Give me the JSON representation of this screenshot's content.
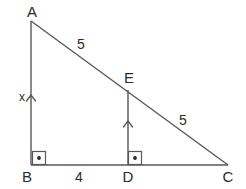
{
  "diagram": {
    "background_color": "#ffffff",
    "stroke_color": "#58585a",
    "text_color": "#2b2b2b",
    "vertices": {
      "A": {
        "label": "A",
        "x": 31,
        "y": 21,
        "label_x": 32,
        "label_y": 17
      },
      "B": {
        "label": "B",
        "x": 31,
        "y": 165,
        "label_x": 27,
        "label_y": 182
      },
      "C": {
        "label": "C",
        "x": 228,
        "y": 165,
        "label_x": 228,
        "label_y": 182
      },
      "D": {
        "label": "D",
        "x": 128,
        "y": 165,
        "label_x": 128,
        "label_y": 182
      },
      "E": {
        "label": "E",
        "x": 128,
        "y": 90,
        "label_x": 129,
        "label_y": 83
      }
    },
    "segments": [
      {
        "name": "AB",
        "from": "A",
        "to": "B"
      },
      {
        "name": "BC",
        "from": "B",
        "to": "C"
      },
      {
        "name": "AC",
        "from": "A",
        "to": "C"
      },
      {
        "name": "DE",
        "from": "D",
        "to": "E"
      }
    ],
    "measures": [
      {
        "name": "AE",
        "label": "5",
        "x": 81,
        "y": 49
      },
      {
        "name": "EC",
        "label": "5",
        "x": 183,
        "y": 125
      },
      {
        "name": "BD",
        "label": "4",
        "x": 79,
        "y": 182
      },
      {
        "name": "AB",
        "label": "x",
        "x": 22,
        "y": 101
      }
    ],
    "right_angles": [
      {
        "name": "angle-B",
        "x": 32,
        "y": 151,
        "size": 14
      },
      {
        "name": "angle-D",
        "x": 128,
        "y": 151,
        "size": 14
      }
    ],
    "direction_marks": [
      {
        "name": "mark-on-AB",
        "x": 31,
        "y": 96
      },
      {
        "name": "mark-on-DE",
        "x": 128,
        "y": 122
      }
    ]
  }
}
